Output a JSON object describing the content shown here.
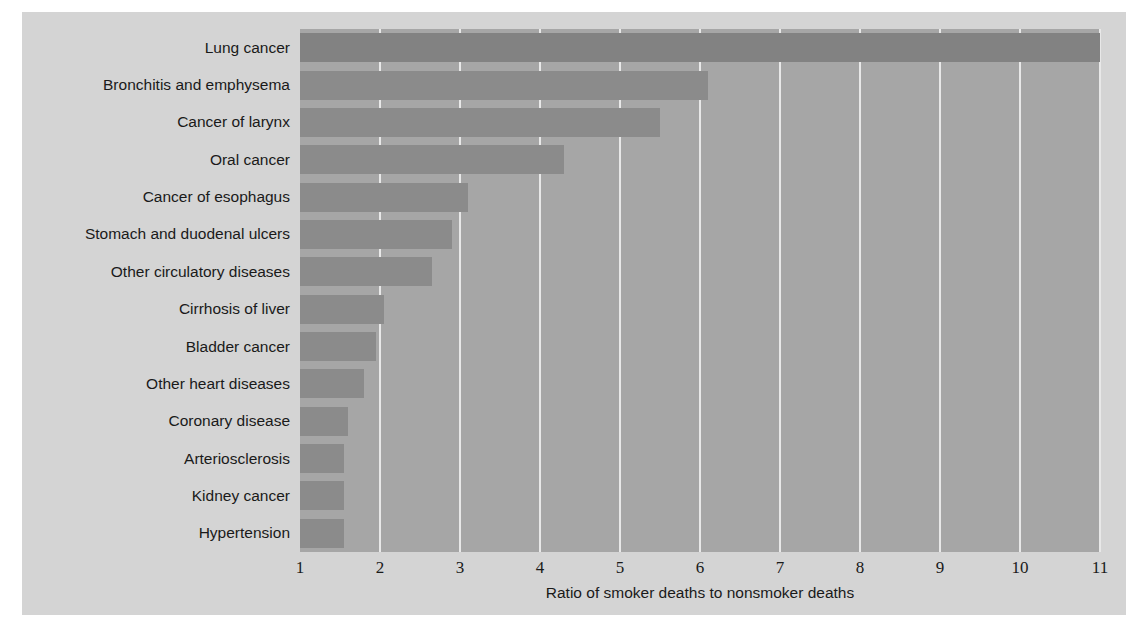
{
  "chart_data": {
    "type": "bar",
    "orientation": "horizontal",
    "title": "",
    "xlabel": "Ratio of smoker deaths to nonsmoker deaths",
    "ylabel": "",
    "xlim": [
      1,
      11
    ],
    "xticks": [
      1,
      2,
      3,
      4,
      5,
      6,
      7,
      8,
      9,
      10,
      11
    ],
    "grid": "vertical",
    "legend": "none",
    "categories": [
      "Lung cancer",
      "Bronchitis and emphysema",
      "Cancer of larynx",
      "Oral cancer",
      "Cancer of esophagus",
      "Stomach and duodenal ulcers",
      "Other circulatory diseases",
      "Cirrhosis of liver",
      "Bladder cancer",
      "Other heart diseases",
      "Coronary disease",
      "Arteriosclerosis",
      "Kidney cancer",
      "Hypertension"
    ],
    "values": [
      11.0,
      6.1,
      5.5,
      4.3,
      3.1,
      2.9,
      2.65,
      2.05,
      1.95,
      1.8,
      1.6,
      1.55,
      1.55,
      1.55
    ]
  },
  "style": {
    "figure_background": "#d4d4d4",
    "plot_background": "#a6a6a6",
    "bar_color": "#8b8b8b",
    "gridline_color": "#e8e8e8",
    "text_color": "#1a1a1a"
  }
}
